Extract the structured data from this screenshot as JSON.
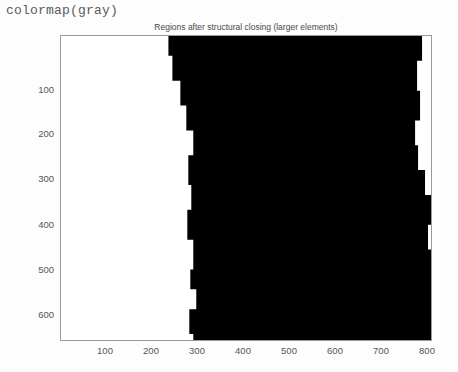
{
  "code_label": "colormap(gray)",
  "figure": {
    "title": "Regions after structural closing (larger elements)",
    "xticks": [
      "100",
      "200",
      "300",
      "400",
      "500",
      "600",
      "700",
      "800"
    ],
    "yticks": [
      "100",
      "200",
      "300",
      "400",
      "500",
      "600"
    ],
    "colors": {
      "foreground": "#000000",
      "background": "#ffffff",
      "axis": "#9a9a9a",
      "tick_text": "#555555",
      "title_text": "#4a4a4a",
      "code_text": "#5b5b5b"
    }
  },
  "chart_data": {
    "type": "heatmap",
    "title": "Regions after structural closing (larger elements)",
    "xlabel": "",
    "ylabel": "",
    "xlim": [
      0,
      820
    ],
    "ylim": [
      660,
      0
    ],
    "grid": false,
    "legend": "none",
    "colormap": "gray",
    "value_range": [
      0,
      1
    ],
    "xticks": [
      100,
      200,
      300,
      400,
      500,
      600,
      700,
      800
    ],
    "yticks": [
      100,
      200,
      300,
      400,
      500,
      600
    ],
    "region_left_boundary": [
      {
        "y": 0,
        "x": 108
      },
      {
        "y": 20,
        "x": 112
      },
      {
        "y": 45,
        "x": 120
      },
      {
        "y": 70,
        "x": 126
      },
      {
        "y": 95,
        "x": 133
      },
      {
        "y": 120,
        "x": 128
      },
      {
        "y": 150,
        "x": 131
      },
      {
        "y": 175,
        "x": 127
      },
      {
        "y": 205,
        "x": 133
      },
      {
        "y": 235,
        "x": 130
      },
      {
        "y": 255,
        "x": 136
      },
      {
        "y": 275,
        "x": 129
      },
      {
        "y": 300,
        "x": 133
      },
      {
        "y": 306,
        "x": 132
      }
    ],
    "region_right_boundary": [
      {
        "y": 0,
        "x": 366
      },
      {
        "y": 25,
        "x": 363
      },
      {
        "y": 55,
        "x": 358
      },
      {
        "y": 85,
        "x": 361
      },
      {
        "y": 110,
        "x": 356
      },
      {
        "y": 135,
        "x": 359
      },
      {
        "y": 160,
        "x": 366
      },
      {
        "y": 190,
        "x": 372
      },
      {
        "y": 215,
        "x": 369
      },
      {
        "y": 240,
        "x": 376
      },
      {
        "y": 265,
        "x": 373
      },
      {
        "y": 290,
        "x": 380
      },
      {
        "y": 306,
        "x": 381
      }
    ]
  }
}
